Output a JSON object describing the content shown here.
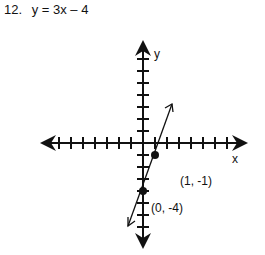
{
  "problem": {
    "number": "12.",
    "equation": "y = 3x – 4"
  },
  "graph": {
    "x_axis_label": "x",
    "y_axis_label": "y",
    "points": [
      {
        "label": "(1, -1)",
        "x": 1,
        "y": -1
      },
      {
        "label": "(0, -4)",
        "x": 0,
        "y": -4
      }
    ],
    "line": {
      "slope": 3,
      "intercept": -4
    },
    "tick_spacing": 1,
    "x_range": [
      -8,
      8
    ],
    "y_range": [
      -8,
      8
    ]
  }
}
